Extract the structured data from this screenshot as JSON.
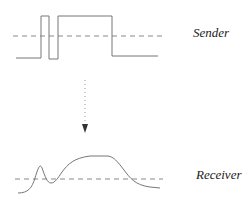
{
  "labels": {
    "sender": "Sender",
    "receiver": "Receiver"
  },
  "colors": {
    "signal": "#777777",
    "threshold": "#888888",
    "arrow": "#333333"
  }
}
